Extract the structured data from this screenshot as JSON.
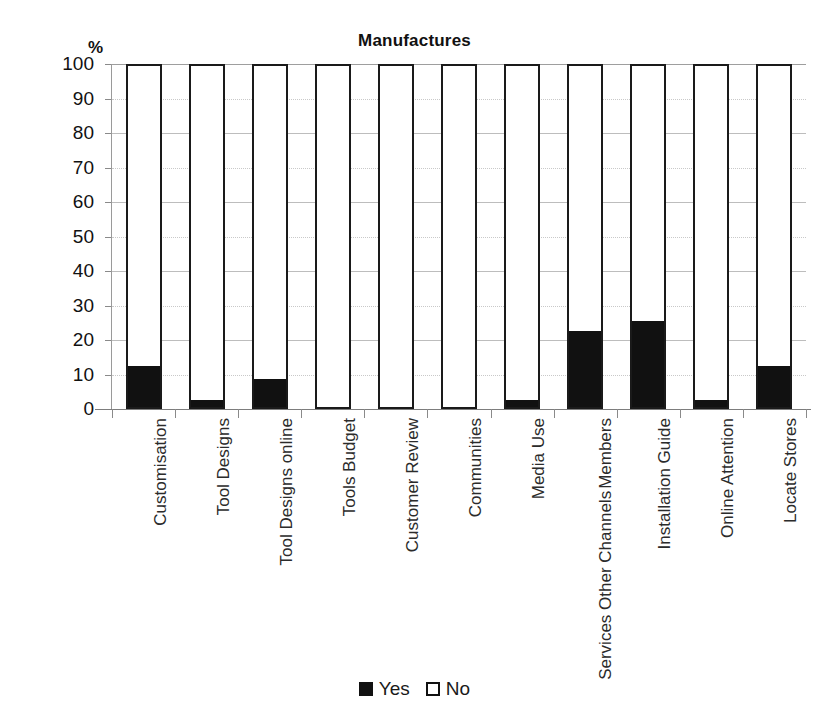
{
  "chart_data": {
    "type": "bar",
    "title": "Manufactures",
    "subtitle": "",
    "xlabel": "",
    "ylabel": "%",
    "ylim": [
      0,
      100
    ],
    "ytick_step": 10,
    "yticks": [
      0,
      10,
      20,
      30,
      40,
      50,
      60,
      70,
      80,
      90,
      100
    ],
    "grid": true,
    "stacked": true,
    "stack_total": 100,
    "legend_position": "bottom",
    "categories": [
      "Customisation",
      "Tool Designs",
      "Tool Designs online",
      "Tools Budget",
      "Customer Review",
      "Communities",
      "Media Use",
      "Services Other Channels Members",
      "Installation Guide",
      "Online Attention",
      "Locate Stores"
    ],
    "category_label_lines": [
      [
        "Customisation"
      ],
      [
        "Tool Designs"
      ],
      [
        "Tool Designs online"
      ],
      [
        "Tools Budget"
      ],
      [
        "Customer Review"
      ],
      [
        "Communities"
      ],
      [
        "Media Use"
      ],
      [
        "Services Other Channels",
        "Members"
      ],
      [
        "Installation Guide"
      ],
      [
        "Online Attention"
      ],
      [
        "Locate Stores"
      ]
    ],
    "series": [
      {
        "name": "Yes",
        "color": "#111111",
        "values": [
          12,
          2,
          8,
          0,
          0,
          0,
          2,
          22,
          25,
          2,
          12
        ]
      },
      {
        "name": "No",
        "color": "#ffffff",
        "values": [
          88,
          98,
          92,
          100,
          100,
          100,
          98,
          78,
          75,
          98,
          88
        ]
      }
    ]
  },
  "legend": {
    "items": [
      {
        "label": "Yes",
        "style": "filled"
      },
      {
        "label": "No",
        "style": "hollow"
      }
    ]
  }
}
